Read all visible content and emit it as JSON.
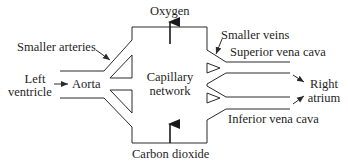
{
  "diagram": {
    "labels": {
      "oxygen": "Oxygen",
      "carbon_dioxide": "Carbon dioxide",
      "smaller_arteries": "Smaller arteries",
      "left_ventricle_line1": "Left",
      "left_ventricle_line2": "ventricle",
      "aorta": "Aorta",
      "capillary_line1": "Capillary",
      "capillary_line2": "network",
      "smaller_veins": "Smaller veins",
      "superior_vena_cava": "Superior vena cava",
      "inferior_vena_cava": "Inferior vena cava",
      "right_atrium_line1": "Right",
      "right_atrium_line2": "atrium"
    },
    "nodes": [
      "Left ventricle",
      "Aorta",
      "Smaller arteries",
      "Capillary network",
      "Smaller veins",
      "Superior vena cava",
      "Inferior vena cava",
      "Right atrium"
    ],
    "edges": [
      {
        "from": "Left ventricle",
        "to": "Aorta"
      },
      {
        "from": "Aorta",
        "to": "Smaller arteries"
      },
      {
        "from": "Smaller arteries",
        "to": "Capillary network"
      },
      {
        "from": "Capillary network",
        "to": "Smaller veins"
      },
      {
        "from": "Smaller veins",
        "to": "Superior vena cava"
      },
      {
        "from": "Smaller veins",
        "to": "Inferior vena cava"
      },
      {
        "from": "Superior vena cava",
        "to": "Right atrium"
      },
      {
        "from": "Inferior vena cava",
        "to": "Right atrium"
      },
      {
        "from": "Capillary network",
        "to": "Oxygen",
        "note": "arrow up out of top"
      },
      {
        "from": "Carbon dioxide",
        "to": "Capillary network",
        "note": "arrow up into bottom"
      }
    ],
    "line_color": "#2a2a2a"
  }
}
